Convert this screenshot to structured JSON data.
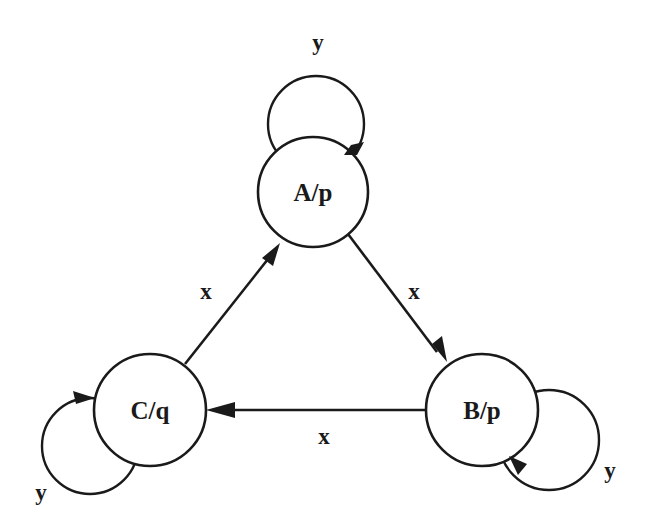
{
  "diagram": {
    "type": "moore-state-machine",
    "states": [
      {
        "id": "A",
        "label": "A/p",
        "output": "p"
      },
      {
        "id": "B",
        "label": "B/p",
        "output": "p"
      },
      {
        "id": "C",
        "label": "C/q",
        "output": "q"
      }
    ],
    "transitions": [
      {
        "from": "A",
        "to": "A",
        "label": "y"
      },
      {
        "from": "A",
        "to": "B",
        "label": "x"
      },
      {
        "from": "B",
        "to": "B",
        "label": "y"
      },
      {
        "from": "B",
        "to": "C",
        "label": "x"
      },
      {
        "from": "C",
        "to": "C",
        "label": "y"
      },
      {
        "from": "C",
        "to": "A",
        "label": "x"
      }
    ]
  }
}
